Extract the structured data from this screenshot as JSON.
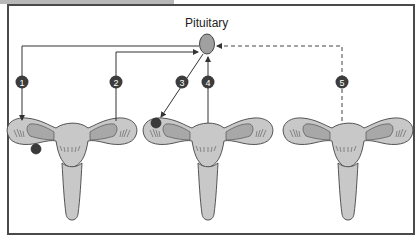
{
  "diagram": {
    "title_label": "Pituitary",
    "pathways": [
      {
        "id": 1,
        "label": "1",
        "direction": "pituitary-to-ovary",
        "style": "solid"
      },
      {
        "id": 2,
        "label": "2",
        "direction": "uterus-to-pituitary",
        "style": "solid"
      },
      {
        "id": 3,
        "label": "3",
        "direction": "pituitary-to-ovary",
        "style": "solid"
      },
      {
        "id": 4,
        "label": "4",
        "direction": "uterus-to-pituitary",
        "style": "solid"
      },
      {
        "id": 5,
        "label": "5",
        "direction": "uterus-to-pituitary",
        "style": "dashed"
      }
    ],
    "panels": [
      {
        "name": "reproductive-tract-1",
        "follicle": "right-ovary-bottom"
      },
      {
        "name": "reproductive-tract-2",
        "follicle": "left-ovary-top"
      },
      {
        "name": "reproductive-tract-3",
        "follicle": "none"
      }
    ],
    "colors": {
      "organ_fill": "#c8c8c8",
      "ovary_fill": "#a8a8a8",
      "pituitary_fill": "#a0a0a0",
      "follicle_fill": "#3a3a3a",
      "badge_fill": "#3c3c3c",
      "line": "#333333",
      "frame": "#4a4a4a"
    }
  }
}
